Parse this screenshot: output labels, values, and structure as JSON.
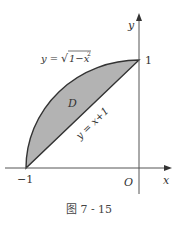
{
  "diagram": {
    "curve_label": "y = √(1−x²)",
    "curve_prefix": "y =",
    "curve_radicand": "1−x",
    "curve_exp": "2",
    "line_label": "y = x+1",
    "region_label": "D",
    "y_axis_label": "y",
    "x_axis_label": "x",
    "origin_label": "O",
    "tick_y1": "1",
    "tick_xm1": "−1",
    "caption": "图 7 - 15",
    "colors": {
      "fill": "#b3b3b3",
      "stroke": "#333333",
      "axis": "#555555"
    }
  }
}
